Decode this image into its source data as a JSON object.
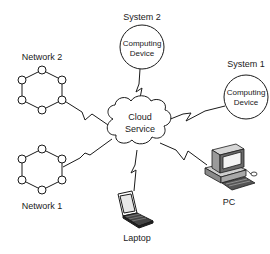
{
  "diagram": {
    "center": {
      "line1": "Cloud",
      "line2": "Service"
    },
    "systems": [
      {
        "title": "System 2",
        "line1": "Computing",
        "line2": "Device"
      },
      {
        "title": "System 1",
        "line1": "Computing",
        "line2": "Device"
      }
    ],
    "networks": [
      {
        "title": "Network 2"
      },
      {
        "title": "Network 1"
      }
    ],
    "devices": {
      "laptop": "Laptop",
      "pc": "PC"
    },
    "colors": {
      "stroke": "#1a1a1a",
      "background": "#ffffff"
    }
  }
}
